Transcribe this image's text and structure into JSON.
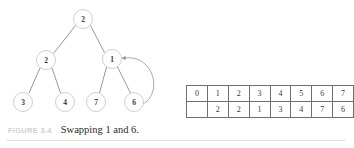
{
  "figure": {
    "caption_tag": "FIGURE 3.4",
    "caption_text": "Swapping 1 and 6.",
    "colors": {
      "background": "#ffffff",
      "node_stroke": "#c9c9c9",
      "edge_stroke": "#8d8d8d",
      "arrow_stroke": "#a0a0a0",
      "table_border": "#6f6f6f",
      "text": "#3a3a3a",
      "caption_tag": "#cfcfcf",
      "rule": "#e2e2e2"
    }
  },
  "tree": {
    "nodes": [
      {
        "id": "root",
        "label": "2",
        "cx": 83,
        "cy": 19,
        "r": 9.5
      },
      {
        "id": "left",
        "label": "2",
        "cx": 46,
        "cy": 60,
        "r": 9.5
      },
      {
        "id": "right",
        "label": "1",
        "cx": 112,
        "cy": 59,
        "r": 9.5
      },
      {
        "id": "ll",
        "label": "3",
        "cx": 23,
        "cy": 102,
        "r": 9.5
      },
      {
        "id": "lr",
        "label": "4",
        "cx": 65,
        "cy": 102,
        "r": 9.5
      },
      {
        "id": "rl",
        "label": "7",
        "cx": 96,
        "cy": 102,
        "r": 9.5
      },
      {
        "id": "rr",
        "label": "6",
        "cx": 134,
        "cy": 102,
        "r": 9.5
      }
    ],
    "edges": [
      {
        "from": "root",
        "to": "left"
      },
      {
        "from": "root",
        "to": "right"
      },
      {
        "from": "left",
        "to": "ll"
      },
      {
        "from": "left",
        "to": "lr"
      },
      {
        "from": "right",
        "to": "rl"
      },
      {
        "from": "right",
        "to": "rr"
      }
    ],
    "swap_arrow": {
      "from_node": "rr",
      "to_node": "right",
      "description": "curved arrow from node 6 to node 1"
    }
  },
  "array": {
    "index_row": [
      "0",
      "1",
      "2",
      "3",
      "4",
      "5",
      "6",
      "7"
    ],
    "value_row": [
      "",
      "2",
      "2",
      "1",
      "3",
      "4",
      "7",
      "6"
    ]
  }
}
